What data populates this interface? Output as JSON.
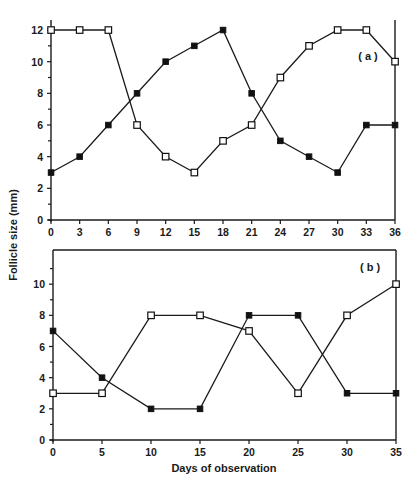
{
  "chart_data": {
    "ylabel": "Follicle size (mm)",
    "xlabel": "Days of observation",
    "panels": [
      {
        "type": "line",
        "label": "( a )",
        "xlim": [
          0,
          36
        ],
        "ylim": [
          0,
          12
        ],
        "xticks": [
          0,
          3,
          6,
          9,
          12,
          15,
          18,
          21,
          24,
          27,
          30,
          33,
          36
        ],
        "yticks_labeled": [
          0,
          2,
          4,
          6,
          8,
          10,
          12
        ],
        "yticks_minor": [
          1,
          3,
          5,
          7,
          9,
          11
        ],
        "grid": false,
        "series": [
          {
            "name": "filled-squares",
            "marker": "filled-square",
            "x": [
              0,
              3,
              6,
              9,
              12,
              15,
              18,
              21,
              24,
              27,
              30,
              33,
              36
            ],
            "y": [
              3,
              4,
              6,
              8,
              10,
              11,
              12,
              8,
              5,
              4,
              3,
              6,
              6
            ]
          },
          {
            "name": "open-squares",
            "marker": "open-square",
            "x": [
              0,
              3,
              6,
              9,
              12,
              15,
              18,
              21,
              24,
              27,
              30,
              33,
              36
            ],
            "y": [
              12,
              12,
              12,
              6,
              4,
              3,
              5,
              6,
              9,
              11,
              12,
              12,
              10
            ]
          }
        ]
      },
      {
        "type": "line",
        "label": "( b )",
        "xlim": [
          0,
          35
        ],
        "ylim": [
          0,
          12
        ],
        "xticks": [
          0,
          5,
          10,
          15,
          20,
          25,
          30,
          35
        ],
        "yticks_labeled": [
          0,
          2,
          4,
          6,
          8,
          10
        ],
        "yticks_minor": [
          1,
          3,
          5,
          7,
          9,
          11
        ],
        "grid": false,
        "series": [
          {
            "name": "filled-squares",
            "marker": "filled-square",
            "x": [
              0,
              5,
              10,
              15,
              20,
              25,
              30,
              35
            ],
            "y": [
              7,
              4,
              2,
              2,
              8,
              8,
              3,
              3
            ]
          },
          {
            "name": "open-squares",
            "marker": "open-square",
            "x": [
              0,
              5,
              10,
              15,
              20,
              25,
              30,
              35
            ],
            "y": [
              3,
              3,
              8,
              8,
              7,
              3,
              8,
              10
            ]
          }
        ]
      }
    ]
  }
}
